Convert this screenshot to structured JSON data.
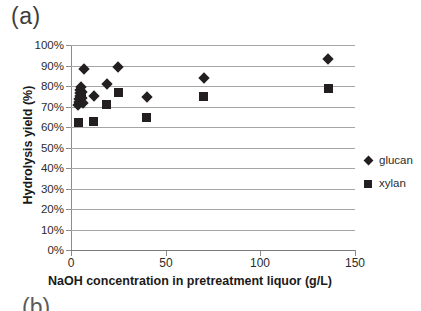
{
  "figure": {
    "panel_label": "(a)",
    "next_panel_label": "(b)"
  },
  "legend": {
    "position": "right",
    "entries": [
      {
        "label": "glucan",
        "marker": "diamond"
      },
      {
        "label": "xylan",
        "marker": "square"
      }
    ]
  },
  "chart_data": {
    "type": "scatter",
    "title": "(a)",
    "xlabel": "NaOH concentration in pretreatment liquor (g/L)",
    "ylabel": "Hydrolysis yield (%)",
    "xlim": [
      0,
      150
    ],
    "ylim": [
      0,
      100
    ],
    "xticks": [
      0,
      50,
      100,
      150
    ],
    "xtick_labels": [
      "0",
      "50",
      "100",
      "150"
    ],
    "yticks": [
      0,
      10,
      20,
      30,
      40,
      50,
      60,
      70,
      80,
      90,
      100
    ],
    "ytick_labels": [
      "0%",
      "10%",
      "20%",
      "30%",
      "40%",
      "50%",
      "60%",
      "70%",
      "80%",
      "90%",
      "100%"
    ],
    "grid": "horizontal",
    "legend_position": "right",
    "marker_color": "#231f20",
    "series": [
      {
        "name": "glucan",
        "marker": "diamond",
        "points": [
          {
            "x": 3.5,
            "y": 70.5
          },
          {
            "x": 4.0,
            "y": 72.0
          },
          {
            "x": 4.2,
            "y": 73.5
          },
          {
            "x": 4.5,
            "y": 75.0
          },
          {
            "x": 4.8,
            "y": 76.5
          },
          {
            "x": 5.0,
            "y": 78.0
          },
          {
            "x": 5.3,
            "y": 79.5
          },
          {
            "x": 5.6,
            "y": 77.0
          },
          {
            "x": 6.0,
            "y": 74.0
          },
          {
            "x": 6.3,
            "y": 71.5
          },
          {
            "x": 7.0,
            "y": 88.5
          },
          {
            "x": 12.0,
            "y": 75.0
          },
          {
            "x": 19.0,
            "y": 81.0
          },
          {
            "x": 25.0,
            "y": 89.5
          },
          {
            "x": 40.0,
            "y": 74.5
          },
          {
            "x": 70.0,
            "y": 84.0
          },
          {
            "x": 136.0,
            "y": 93.0
          }
        ]
      },
      {
        "name": "xylan",
        "marker": "square",
        "points": [
          {
            "x": 4.0,
            "y": 62.0
          },
          {
            "x": 5.5,
            "y": 76.0
          },
          {
            "x": 12.0,
            "y": 62.5
          },
          {
            "x": 19.0,
            "y": 71.0
          },
          {
            "x": 25.0,
            "y": 77.0
          },
          {
            "x": 40.0,
            "y": 64.5
          },
          {
            "x": 70.0,
            "y": 75.0
          },
          {
            "x": 136.0,
            "y": 79.0
          }
        ]
      }
    ]
  }
}
